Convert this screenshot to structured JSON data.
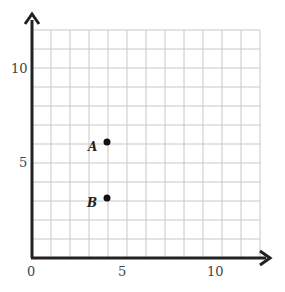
{
  "chart_data": {
    "type": "scatter",
    "title": "",
    "xlabel": "",
    "ylabel": "",
    "xlim": [
      0,
      12
    ],
    "ylim": [
      0,
      12
    ],
    "grid": true,
    "x_ticks": [
      "0",
      "5",
      "10"
    ],
    "y_ticks": [
      "5",
      "10"
    ],
    "points": [
      {
        "label": "A",
        "x": 4,
        "y": 6
      },
      {
        "label": "B",
        "x": 4,
        "y": 3
      }
    ]
  },
  "labels": {
    "origin": "0",
    "x5": "5",
    "x10": "10",
    "y5": "5",
    "y10": "10",
    "pointA": "A",
    "pointB": "B"
  }
}
